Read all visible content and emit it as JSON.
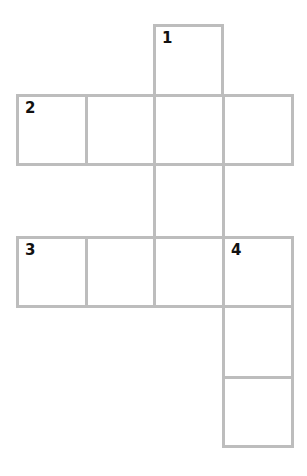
{
  "puzzle": {
    "type": "crossword",
    "grid_origin": {
      "x": 16,
      "y": 24
    },
    "cell_size": 70,
    "border_color": "#bdbdbd",
    "number_color": "#111111",
    "cells": [
      {
        "row": 0,
        "col": 2,
        "number": "1"
      },
      {
        "row": 1,
        "col": 0,
        "number": "2"
      },
      {
        "row": 1,
        "col": 1,
        "number": ""
      },
      {
        "row": 1,
        "col": 2,
        "number": ""
      },
      {
        "row": 1,
        "col": 3,
        "number": ""
      },
      {
        "row": 2,
        "col": 2,
        "number": ""
      },
      {
        "row": 3,
        "col": 0,
        "number": "3"
      },
      {
        "row": 3,
        "col": 1,
        "number": ""
      },
      {
        "row": 3,
        "col": 2,
        "number": ""
      },
      {
        "row": 3,
        "col": 3,
        "number": "4"
      },
      {
        "row": 4,
        "col": 3,
        "number": ""
      },
      {
        "row": 5,
        "col": 3,
        "number": ""
      }
    ]
  }
}
